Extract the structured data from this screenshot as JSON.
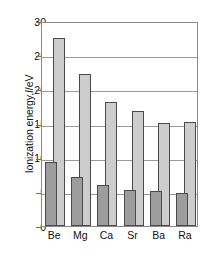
{
  "chart_data": {
    "type": "bar",
    "title": "",
    "subtitle": "",
    "xlabel": "",
    "ylabel": "Ionization energy, I/eV",
    "ylabel_plain": "Ionization energy,",
    "ylabel_symbol": "I",
    "ylabel_unit": "/eV",
    "categories": [
      "Be",
      "Mg",
      "Ca",
      "Sr",
      "Ba",
      "Ra"
    ],
    "ylim": [
      0,
      30
    ],
    "yticks": [
      0,
      5,
      10,
      15,
      20,
      25,
      30
    ],
    "ytick_labels": [
      "0",
      "5",
      "10",
      "15",
      "20",
      "25",
      "30"
    ],
    "grid": "horizontal",
    "legend": "none",
    "series": [
      {
        "name": "First ionization energy",
        "color": "#9d9d9d",
        "values": [
          9.3,
          7.1,
          6.0,
          5.3,
          5.1,
          4.9
        ]
      },
      {
        "name": "Second ionization energy",
        "color": "#cdcdcd",
        "values": [
          27.5,
          22.2,
          18.2,
          16.9,
          15.1,
          15.2
        ]
      }
    ],
    "annotations": []
  }
}
